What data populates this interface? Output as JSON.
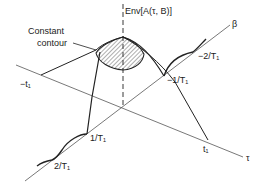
{
  "diagram": {
    "type": "3d-surface-sketch",
    "envelope_label": "Env[A(τ, B)]",
    "contour_label_line1": "Constant",
    "contour_label_line2": "contour",
    "axes": {
      "tau": "τ",
      "beta": "β"
    },
    "tau_ticks": {
      "neg_t1": "−t₁",
      "pos_t1": "t₁"
    },
    "beta_ticks": {
      "pos_1": "1/T₁",
      "pos_2": "2/T₁",
      "neg_1": "−1/T₁",
      "neg_2": "−2/T₁"
    },
    "colors": {
      "line": "#222222",
      "axis": "#444444",
      "background": "#ffffff"
    }
  }
}
